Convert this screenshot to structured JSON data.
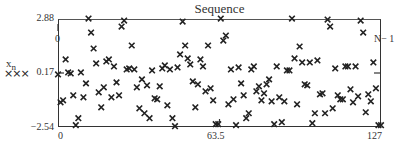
{
  "chart_data": {
    "type": "scatter",
    "title": "Sequence",
    "xlabel": "",
    "ylabel": "x_n",
    "ylabel_main": "x",
    "ylabel_sub": "n",
    "legend": [
      {
        "name": "x_n",
        "marker": "×××"
      }
    ],
    "xlim": [
      0,
      127
    ],
    "ylim": [
      -2.54,
      2.88
    ],
    "x_tick_labels": [
      "0",
      "63.5",
      "127"
    ],
    "y_tick_labels": [
      "2.88",
      "0.17",
      "-2.54"
    ],
    "y_tick_labels_display": [
      "2.88",
      "0.17",
      "−2.54"
    ],
    "markers": {
      "vertical_marker_label": "0",
      "horizontal_marker_label": "N− 1",
      "x_marker_value": 63.5,
      "y_marker_value": 0.17
    },
    "grid": false,
    "x": [
      0,
      1,
      2,
      3,
      4,
      5,
      6,
      7,
      8,
      9,
      10,
      11,
      12,
      13,
      14,
      15,
      16,
      17,
      18,
      19,
      20,
      21,
      22,
      23,
      24,
      25,
      26,
      27,
      28,
      29,
      30,
      31,
      32,
      33,
      34,
      35,
      36,
      37,
      38,
      39,
      40,
      41,
      42,
      43,
      44,
      45,
      46,
      47,
      48,
      49,
      50,
      51,
      52,
      53,
      54,
      55,
      56,
      57,
      58,
      59,
      60,
      61,
      62,
      63,
      64,
      65,
      66,
      67,
      68,
      69,
      70,
      71,
      72,
      73,
      74,
      75,
      76,
      77,
      78,
      79,
      80,
      81,
      82,
      83,
      84,
      85,
      86,
      87,
      88,
      89,
      90,
      91,
      92,
      93,
      94,
      95,
      96,
      97,
      98,
      99,
      100,
      101,
      102,
      103,
      104,
      105,
      106,
      107,
      108,
      109,
      110,
      111,
      112,
      113,
      114,
      115,
      116,
      117,
      118,
      119,
      120,
      121,
      122,
      123,
      124,
      125,
      126,
      127
    ],
    "values": [
      0.1,
      -1.3,
      -1.2,
      0.85,
      0.2,
      0.15,
      -0.95,
      -2.45,
      -2.1,
      0.2,
      -1.05,
      -0.35,
      2.9,
      2.2,
      1.4,
      0.65,
      -0.8,
      -1.55,
      -0.55,
      0.75,
      0.85,
      -1.05,
      0.5,
      -0.3,
      -0.95,
      2.5,
      2.8,
      0.35,
      0.4,
      1.55,
      0.35,
      -0.55,
      -1.6,
      -0.15,
      -1.85,
      -0.45,
      -2.1,
      0.3,
      -1.1,
      -1.15,
      -0.5,
      0.4,
      0.55,
      -1.45,
      0.35,
      -2.1,
      -2.5,
      0.45,
      1.1,
      2.75,
      1.55,
      0.9,
      0.6,
      -0.25,
      -1.55,
      -0.4,
      0.85,
      0.5,
      -0.75,
      1.55,
      -0.6,
      -1.2,
      -2.4,
      -2.4,
      2.9,
      1.8,
      2.05,
      -1.4,
      0.35,
      -1.15,
      -2.45,
      0.45,
      -0.35,
      -0.95,
      -2.1,
      -1.85,
      0.35,
      0.5,
      -0.75,
      -0.5,
      -1.2,
      -0.85,
      -0.4,
      -0.15,
      -1.25,
      -2.4,
      0.5,
      -1.05,
      -2.3,
      -1.25,
      0.3,
      0.3,
      2.9,
      0.9,
      -1.4,
      1.5,
      0.7,
      -0.4,
      -0.45,
      0.7,
      -2.35,
      -1.85,
      0.8,
      -0.9,
      -0.85,
      -1.85,
      2.85,
      2.5,
      -1.6,
      0.4,
      -0.95,
      -1.15,
      -1.15,
      0.5,
      0.5,
      -0.65,
      -1.3,
      0.5,
      -1.0,
      2.8,
      2.2,
      -1.8,
      -0.9,
      -1.25,
      0.7,
      -0.6,
      -2.45,
      -2.45
    ]
  }
}
